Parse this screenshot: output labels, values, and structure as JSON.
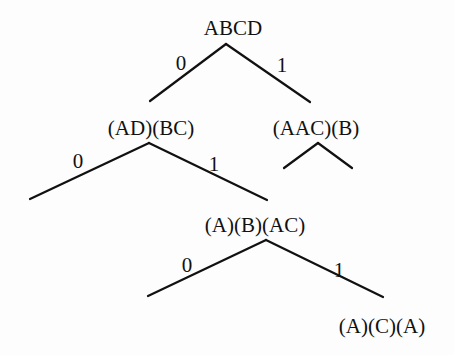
{
  "diagram": {
    "type": "binary-tree",
    "nodes": [
      {
        "id": "root",
        "label": "ABCD",
        "x": 233,
        "y": 18
      },
      {
        "id": "n0",
        "label": "(AD)(BC)",
        "x": 151,
        "y": 118
      },
      {
        "id": "n1",
        "label": "(AAC)(B)",
        "x": 316,
        "y": 118
      },
      {
        "id": "n01",
        "label": "(A)(B)(AC)",
        "x": 255,
        "y": 215
      },
      {
        "id": "n011",
        "label": "(A)(C)(A)",
        "x": 382,
        "y": 316
      }
    ],
    "edges": [
      {
        "from": "root",
        "to": "n0",
        "label": "0",
        "x1": 226,
        "y1": 44,
        "x2": 150,
        "y2": 101,
        "lx": 181,
        "ly": 63
      },
      {
        "from": "root",
        "to": "n1",
        "label": "1",
        "x1": 226,
        "y1": 44,
        "x2": 310,
        "y2": 102,
        "lx": 282,
        "ly": 65
      },
      {
        "from": "n0",
        "to": "n00",
        "label": "0",
        "x1": 149,
        "y1": 143,
        "x2": 30,
        "y2": 199,
        "lx": 78,
        "ly": 161
      },
      {
        "from": "n0",
        "to": "n01",
        "label": "1",
        "x1": 149,
        "y1": 143,
        "x2": 267,
        "y2": 200,
        "lx": 214,
        "ly": 164
      },
      {
        "from": "n1",
        "to": "n10",
        "label": "",
        "x1": 318,
        "y1": 143,
        "x2": 284,
        "y2": 168
      },
      {
        "from": "n1",
        "to": "n11",
        "label": "",
        "x1": 318,
        "y1": 143,
        "x2": 352,
        "y2": 168
      },
      {
        "from": "n01",
        "to": "n010",
        "label": "0",
        "x1": 266,
        "y1": 240,
        "x2": 148,
        "y2": 296,
        "lx": 187,
        "ly": 265
      },
      {
        "from": "n01",
        "to": "n011",
        "label": "1",
        "x1": 266,
        "y1": 240,
        "x2": 383,
        "y2": 297,
        "lx": 339,
        "ly": 270
      }
    ],
    "colors": {
      "background": "#fdfdfd",
      "ink": "#111111"
    }
  }
}
